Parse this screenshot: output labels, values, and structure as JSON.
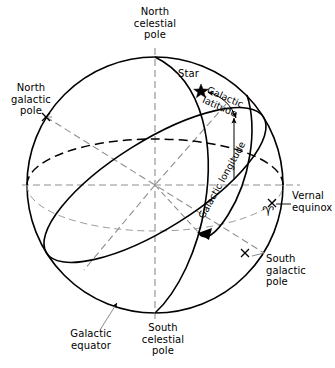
{
  "figure": {
    "width": 335,
    "height": 368,
    "background": "#ffffff",
    "ink": "#000000"
  },
  "labels": {
    "north_celestial_pole": "North\ncelestial\npole",
    "south_celestial_pole": "South\ncelestial\npole",
    "north_galactic_pole": "North\ngalactic\npole",
    "south_galactic_pole": "South\ngalactic\npole",
    "galactic_equator": "Galactic\nequator",
    "vernal_equinox": "Vernal\nequinox",
    "star": "Star",
    "galactic_latitude": "Galactic\nlatitude",
    "galactic_longitude": "Galactic longitude"
  },
  "markers": {
    "star_glyph": "★",
    "aries_glyph": "♈",
    "north_galactic_pole_marker": "×",
    "south_galactic_pole_marker": "×",
    "vernal_equinox_marker": "×"
  },
  "geometry": {
    "sphere_center_x": 155,
    "sphere_center_y": 185,
    "sphere_radius": 128,
    "celestial_equator_style": "dashed",
    "galactic_equator_style": "solid",
    "axis_style": "dash-dot"
  },
  "colors": {
    "line": "#000000",
    "dashed_line": "#3a3a3a",
    "axis_line": "#8a8a8a",
    "leader_line": "#7a7a7a"
  }
}
